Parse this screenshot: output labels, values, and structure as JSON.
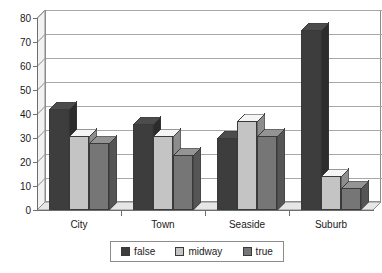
{
  "chart_data": {
    "type": "bar",
    "title": "",
    "subtitle": "",
    "xlabel": "",
    "ylabel": "",
    "categories": [
      "City",
      "Town",
      "Seaside",
      "Suburb"
    ],
    "series": [
      {
        "name": "false",
        "color": "#3d3d3d",
        "values": [
          42,
          36,
          30,
          75
        ]
      },
      {
        "name": "midway",
        "color": "#c4c4c4",
        "values": [
          31,
          31,
          37,
          14
        ]
      },
      {
        "name": "true",
        "color": "#767676",
        "values": [
          28,
          23,
          31,
          9
        ]
      }
    ],
    "ylim": [
      0,
      80
    ],
    "yticks": [
      0,
      10,
      20,
      30,
      40,
      50,
      60,
      70,
      80
    ],
    "ytick_labels": [
      "0",
      "10",
      "20",
      "30",
      "40",
      "50",
      "60",
      "70",
      "80"
    ],
    "grid": true,
    "grid_axis": "y",
    "legend_position": "bottom",
    "style": "3d-column",
    "plot_background": "#ffffff",
    "grid_color": "#a8a8a8",
    "axis_color": "#6e6e6e"
  },
  "legend": {
    "items": [
      {
        "label": "false",
        "color": "#3d3d3d"
      },
      {
        "label": "midway",
        "color": "#c4c4c4"
      },
      {
        "label": "true",
        "color": "#767676"
      }
    ]
  }
}
